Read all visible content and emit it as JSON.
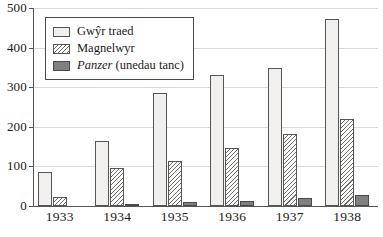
{
  "chart_data": {
    "type": "bar",
    "title": "",
    "subtitle": "",
    "xlabel": "",
    "ylabel": "",
    "ylim": [
      0,
      500
    ],
    "yticks": [
      0,
      100,
      200,
      300,
      400,
      500
    ],
    "ytick_labels": [
      "0",
      "100",
      "200",
      "300",
      "400",
      "500"
    ],
    "grid": true,
    "grid_axis": "y",
    "legend_position": "top-left",
    "categories": [
      "1933",
      "1934",
      "1935",
      "1936",
      "1937",
      "1938"
    ],
    "series": [
      {
        "name": "Gwŷr traed",
        "key": "infantry",
        "fill": "#f2f0ee",
        "edge": "#555555",
        "pattern": "solid",
        "values": [
          85,
          165,
          285,
          332,
          348,
          473
        ]
      },
      {
        "name": "Magnelwyr",
        "key": "artillery",
        "fill": "#fbfbfa",
        "edge": "#555555",
        "pattern": "diagonal-hatch",
        "values": [
          22,
          95,
          113,
          146,
          182,
          220
        ]
      },
      {
        "name": "Panzer (unedau tanc)",
        "key": "panzer",
        "fill": "#7f7f7f",
        "edge": "#4a4a4a",
        "pattern": "solid",
        "values": [
          0,
          4,
          10,
          13,
          20,
          29
        ]
      }
    ]
  },
  "legend": {
    "items": [
      {
        "label": "Gwŷr traed",
        "label_italic": "",
        "label_rest": "",
        "swatch": "infantry"
      },
      {
        "label": "Magnelwyr",
        "label_italic": "",
        "label_rest": "",
        "swatch": "artillery"
      },
      {
        "label": "Panzer (unedau tanc)",
        "label_italic": "Panzer",
        "label_rest": " (unedau tanc)",
        "swatch": "panzer"
      }
    ]
  },
  "axes": {
    "y_tick_labels": [
      "500",
      "400",
      "300",
      "200",
      "100",
      "0"
    ],
    "x_tick_labels": [
      "1933",
      "1934",
      "1935",
      "1936",
      "1937",
      "1938"
    ]
  },
  "colors": {
    "axis": "#555555",
    "grid": "#d9d9d9",
    "infantry": "#f2f0ee",
    "artillery_edge": "#555555",
    "panzer": "#7f7f7f",
    "background": "#ffffff"
  }
}
